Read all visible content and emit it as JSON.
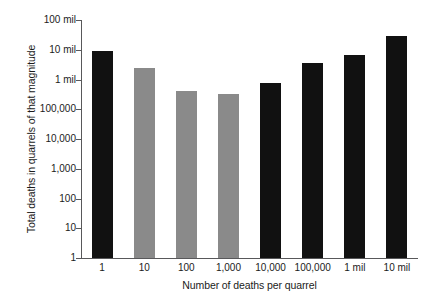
{
  "chart_data": {
    "type": "bar",
    "title": "",
    "xlabel": "Number of deaths per quarrel",
    "ylabel": "Total deaths in quarrels of that magnitude",
    "categories": [
      "1",
      "10",
      "100",
      "1,000",
      "10,000",
      "100,000",
      "1 mil",
      "10 mil"
    ],
    "values": [
      9000000,
      2500000,
      400000,
      330000,
      750000,
      3500000,
      6500000,
      30000000
    ],
    "bar_colors": [
      "#111111",
      "#8a8a8a",
      "#8a8a8a",
      "#8a8a8a",
      "#111111",
      "#111111",
      "#111111",
      "#111111"
    ],
    "yscale": "log",
    "ylim": [
      1,
      100000000
    ],
    "y_tick_labels": [
      "100 mil",
      "10 mil",
      "1 mil",
      "100,000",
      "10,000",
      "1,000",
      "100",
      "10",
      "1"
    ],
    "y_tick_values": [
      100000000,
      10000000,
      1000000,
      100000,
      10000,
      1000,
      100,
      10,
      1
    ],
    "grid": false,
    "legend": "none",
    "axis_color": "#58585a",
    "text_color": "#1b1b1b",
    "background": "#ffffff"
  }
}
